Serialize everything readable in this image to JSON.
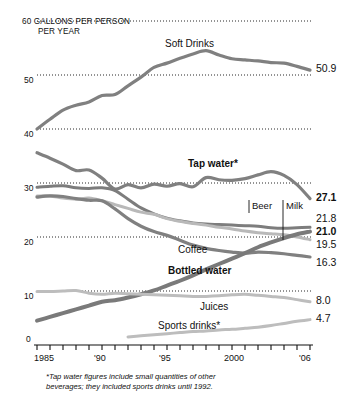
{
  "header": {
    "unit_line1": "60  GALLONS PER PERSON",
    "unit_line2": "PER YEAR"
  },
  "footnote": {
    "line1": "*Tap water figures include small quantities of other",
    "line2": "beverages; they included sports drinks until 1992."
  },
  "callouts": [
    {
      "label": "Beer"
    },
    {
      "label": "Milk"
    }
  ],
  "chart_data": {
    "type": "line",
    "title": "",
    "subtitle": "",
    "xlabel": "",
    "ylabel": "GALLONS PER PERSON PER YEAR",
    "xlim": [
      1985,
      2006
    ],
    "ylim": [
      0,
      60
    ],
    "grid": true,
    "grid_style": "dotted-horizontal",
    "legend": "inline-annotations",
    "yticks": [
      0,
      10,
      20,
      30,
      40,
      50,
      60
    ],
    "ytick_labels": [
      "0",
      "10",
      "20",
      "30",
      "40",
      "50",
      "60"
    ],
    "xticks": [
      1985,
      1986,
      1987,
      1988,
      1989,
      1990,
      1991,
      1992,
      1993,
      1994,
      1995,
      1996,
      1997,
      1998,
      1999,
      2000,
      2001,
      2002,
      2003,
      2004,
      2005,
      2006
    ],
    "xtick_labels": [
      "1985",
      "'90",
      "'95",
      "2000",
      "'06"
    ],
    "xtick_label_years": [
      1985,
      1990,
      1995,
      2000,
      2006
    ],
    "x": [
      1985,
      1986,
      1987,
      1988,
      1989,
      1990,
      1991,
      1992,
      1993,
      1994,
      1995,
      1996,
      1997,
      1998,
      1999,
      2000,
      2001,
      2002,
      2003,
      2004,
      2005,
      2006
    ],
    "series": [
      {
        "name": "Soft Drinks",
        "label": "Soft Drinks",
        "label_bold": false,
        "color": "#808080",
        "width": 3.2,
        "end_value": 50.9,
        "end_value_text": "50.9",
        "end_value_bold": false,
        "values": [
          40.0,
          41.8,
          43.5,
          44.4,
          45.0,
          46.2,
          46.4,
          48.0,
          49.6,
          51.4,
          52.2,
          53.1,
          53.9,
          54.5,
          53.7,
          53.0,
          52.8,
          52.6,
          52.3,
          52.2,
          51.6,
          50.9
        ]
      },
      {
        "name": "Tap water",
        "label": "Tap water*",
        "label_bold": true,
        "color": "#808080",
        "width": 3.2,
        "end_value": 27.1,
        "end_value_text": "27.1",
        "end_value_bold": true,
        "values": [
          35.6,
          34.6,
          33.5,
          32.3,
          32.4,
          30.9,
          28.9,
          29.7,
          29.1,
          29.8,
          29.4,
          29.9,
          29.3,
          31.0,
          30.6,
          30.5,
          30.8,
          31.5,
          32.1,
          31.4,
          29.7,
          27.1
        ]
      },
      {
        "name": "Beer",
        "label": "Beer",
        "label_bold": false,
        "color": "#7d7d7d",
        "width": 3.0,
        "end_value": 21.8,
        "end_value_text": "21.8",
        "end_value_bold": false,
        "values": [
          29.2,
          29.4,
          29.5,
          29.1,
          29.0,
          29.1,
          28.6,
          27.0,
          25.4,
          24.3,
          23.5,
          23.0,
          22.6,
          22.4,
          22.3,
          22.2,
          22.1,
          22.0,
          21.7,
          21.6,
          21.7,
          21.8
        ]
      },
      {
        "name": "Milk",
        "label": "Milk",
        "label_bold": false,
        "color": "#b9b9b9",
        "width": 3.0,
        "end_value": 19.5,
        "end_value_text": "19.5",
        "end_value_bold": false,
        "values": [
          27.6,
          27.6,
          27.2,
          27.0,
          27.2,
          26.7,
          26.0,
          25.3,
          24.6,
          24.2,
          23.4,
          22.9,
          22.5,
          22.2,
          21.8,
          21.5,
          21.1,
          20.8,
          20.6,
          20.4,
          20.0,
          19.5
        ]
      },
      {
        "name": "Coffee",
        "label": "Coffee",
        "label_bold": false,
        "color": "#808080",
        "width": 3.2,
        "end_value": 16.3,
        "end_value_text": "16.3",
        "end_value_bold": false,
        "values": [
          27.4,
          27.6,
          27.5,
          27.1,
          26.8,
          26.7,
          25.2,
          23.4,
          22.0,
          21.0,
          20.3,
          19.4,
          18.5,
          17.9,
          17.5,
          17.2,
          17.0,
          17.2,
          17.1,
          16.9,
          16.6,
          16.3
        ]
      },
      {
        "name": "Bottled water",
        "label": "Bottled water",
        "label_bold": true,
        "color": "#7a7a7a",
        "width": 4.0,
        "end_value": 21.0,
        "end_value_text": "21.0",
        "end_value_bold": true,
        "values": [
          4.5,
          5.2,
          5.9,
          6.6,
          7.3,
          8.0,
          8.3,
          8.8,
          9.4,
          10.1,
          11.0,
          11.9,
          12.9,
          14.0,
          15.0,
          16.0,
          17.0,
          18.1,
          19.0,
          19.8,
          20.5,
          21.0
        ]
      },
      {
        "name": "Juices",
        "label": "Juices",
        "label_bold": false,
        "color": "#bdbdbd",
        "width": 3.0,
        "end_value": 8.0,
        "end_value_text": "8.0",
        "end_value_bold": false,
        "values": [
          9.9,
          9.9,
          10.0,
          10.1,
          9.6,
          9.4,
          9.6,
          9.5,
          9.4,
          9.3,
          9.2,
          9.1,
          9.0,
          9.0,
          9.1,
          9.3,
          9.4,
          9.2,
          9.0,
          8.8,
          8.4,
          8.0
        ]
      },
      {
        "name": "Sports drinks",
        "label": "Sports drinks*",
        "label_bold": false,
        "color": "#bdbdbd",
        "width": 3.0,
        "end_value": 4.7,
        "end_value_text": "4.7",
        "end_value_bold": false,
        "start_year": 1992,
        "values": [
          null,
          null,
          null,
          null,
          null,
          null,
          null,
          1.5,
          1.7,
          1.9,
          2.1,
          2.3,
          2.5,
          2.6,
          2.8,
          2.9,
          3.1,
          3.3,
          3.6,
          4.0,
          4.4,
          4.7
        ]
      }
    ]
  }
}
